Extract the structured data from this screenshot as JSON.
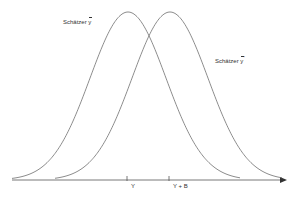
{
  "diagram": {
    "curves": [
      {
        "label_prefix": "Schätzer",
        "symbol": "y",
        "superscript": "",
        "peak_x": 128
      },
      {
        "label_prefix": "Schätzer",
        "symbol": "y",
        "superscript": "*",
        "peak_x": 170
      }
    ],
    "axis": {
      "ticks": [
        {
          "label": "Y",
          "x": 127
        },
        {
          "label": "Y + B",
          "x": 169
        }
      ]
    },
    "colors": {
      "line": "#6e6e6e",
      "axis": "#555555",
      "text": "#333333"
    }
  }
}
